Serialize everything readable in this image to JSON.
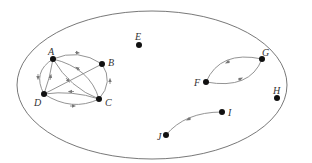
{
  "diagram": {
    "type": "directed-graph",
    "boundary": {
      "shape": "ellipse",
      "cx": 152,
      "cy": 85,
      "rx": 135,
      "ry": 74
    },
    "nodes": [
      {
        "id": "A",
        "label": "A",
        "x": 53,
        "y": 59
      },
      {
        "id": "B",
        "label": "B",
        "x": 102,
        "y": 64
      },
      {
        "id": "C",
        "label": "C",
        "x": 99,
        "y": 99
      },
      {
        "id": "D",
        "label": "D",
        "x": 44,
        "y": 94
      },
      {
        "id": "E",
        "label": "E",
        "x": 139,
        "y": 45
      },
      {
        "id": "F",
        "label": "F",
        "x": 206,
        "y": 82
      },
      {
        "id": "G",
        "label": "G",
        "x": 262,
        "y": 59
      },
      {
        "id": "H",
        "label": "H",
        "x": 277,
        "y": 98
      },
      {
        "id": "I",
        "label": "I",
        "x": 222,
        "y": 112
      },
      {
        "id": "J",
        "label": "J",
        "x": 166,
        "y": 135
      }
    ],
    "edges": [
      {
        "from": "A",
        "to": "B"
      },
      {
        "from": "C",
        "to": "B"
      },
      {
        "from": "A",
        "to": "D"
      },
      {
        "from": "D",
        "to": "A"
      },
      {
        "from": "A",
        "to": "C"
      },
      {
        "from": "D",
        "to": "B"
      },
      {
        "from": "C",
        "to": "D"
      },
      {
        "from": "D",
        "to": "C"
      },
      {
        "from": "C",
        "to": "A"
      },
      {
        "from": "G",
        "to": "F"
      },
      {
        "from": "F",
        "to": "G"
      },
      {
        "from": "I",
        "to": "J"
      }
    ]
  }
}
